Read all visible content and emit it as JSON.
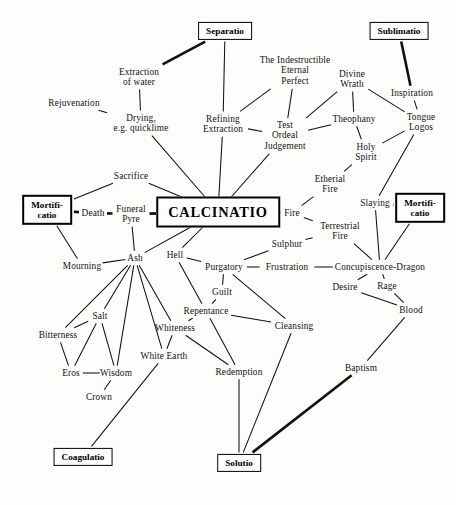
{
  "diagram": {
    "center": {
      "label": "CALCINATIO",
      "x": 218,
      "y": 212
    },
    "boxes": [
      {
        "id": "separatio",
        "label": "Separatio",
        "x": 225,
        "y": 31,
        "lines": [
          "Separatio"
        ]
      },
      {
        "id": "sublimatio",
        "label": "Sublimatio",
        "x": 399,
        "y": 31,
        "lines": [
          "Sublimatio"
        ]
      },
      {
        "id": "mortificatio_left",
        "label": "Mortifi- catio",
        "x": 47,
        "y": 210,
        "lines": [
          "Mortifi-",
          "catio"
        ]
      },
      {
        "id": "mortificatio_right",
        "label": "Mortifi- catio",
        "x": 420,
        "y": 208,
        "lines": [
          "Mortifi-",
          "catio"
        ]
      },
      {
        "id": "coagulatio",
        "label": "Coagulatio",
        "x": 83,
        "y": 457,
        "lines": [
          "Coagulatio"
        ]
      },
      {
        "id": "solutio",
        "label": "Solutio",
        "x": 239,
        "y": 463,
        "lines": [
          "Solutio"
        ]
      }
    ],
    "nodes": [
      {
        "id": "extraction_of_water",
        "lines": [
          "Extraction",
          "of water"
        ],
        "x": 139,
        "y": 77
      },
      {
        "id": "rejuvenation",
        "lines": [
          "Rejuvenation"
        ],
        "x": 74,
        "y": 103
      },
      {
        "id": "drying_quicklime",
        "lines": [
          "Drying,",
          "e.g. quicklime"
        ],
        "x": 141,
        "y": 123
      },
      {
        "id": "refining_extraction",
        "lines": [
          "Refining",
          "Extraction"
        ],
        "x": 223,
        "y": 124
      },
      {
        "id": "indestructible",
        "lines": [
          "The Indestructible",
          "Eternal",
          "Perfect"
        ],
        "x": 295,
        "y": 71
      },
      {
        "id": "test_ordeal_judgement",
        "lines": [
          "Test",
          "Ordeal",
          "Judgement"
        ],
        "x": 285,
        "y": 136
      },
      {
        "id": "divine_wrath",
        "lines": [
          "Divine",
          "Wrath"
        ],
        "x": 352,
        "y": 79
      },
      {
        "id": "theophany",
        "lines": [
          "Theophany"
        ],
        "x": 354,
        "y": 119
      },
      {
        "id": "inspiration",
        "lines": [
          "Inspiration"
        ],
        "x": 412,
        "y": 93
      },
      {
        "id": "tongue_logos",
        "lines": [
          "Tongue",
          "Logos"
        ],
        "x": 421,
        "y": 122
      },
      {
        "id": "holy_spirit",
        "lines": [
          "Holy",
          "Spirit"
        ],
        "x": 366,
        "y": 152
      },
      {
        "id": "etherial_fire",
        "lines": [
          "Etherial",
          "Fire"
        ],
        "x": 330,
        "y": 184
      },
      {
        "id": "slaying",
        "lines": [
          "Slaying"
        ],
        "x": 375,
        "y": 203
      },
      {
        "id": "fire",
        "lines": [
          "Fire"
        ],
        "x": 292,
        "y": 213
      },
      {
        "id": "terrestrial_fire",
        "lines": [
          "Terrestrial",
          "Fire"
        ],
        "x": 340,
        "y": 231
      },
      {
        "id": "sulphur",
        "lines": [
          "Sulphur"
        ],
        "x": 287,
        "y": 244
      },
      {
        "id": "sacrifice",
        "lines": [
          "Sacrifice"
        ],
        "x": 131,
        "y": 176
      },
      {
        "id": "death",
        "lines": [
          "Death"
        ],
        "x": 93,
        "y": 213
      },
      {
        "id": "funeral_pyre",
        "lines": [
          "Funeral",
          "Pyre"
        ],
        "x": 131,
        "y": 214
      },
      {
        "id": "ash",
        "lines": [
          "Ash"
        ],
        "x": 135,
        "y": 258
      },
      {
        "id": "mourning",
        "lines": [
          "Mourning"
        ],
        "x": 82,
        "y": 266
      },
      {
        "id": "hell",
        "lines": [
          "Hell"
        ],
        "x": 175,
        "y": 255
      },
      {
        "id": "purgatory",
        "lines": [
          "Purgatory"
        ],
        "x": 224,
        "y": 267
      },
      {
        "id": "frustration",
        "lines": [
          "Frustration"
        ],
        "x": 287,
        "y": 267
      },
      {
        "id": "concupiscence_dragon",
        "lines": [
          "Concupiscence-Dragon"
        ],
        "x": 380,
        "y": 267
      },
      {
        "id": "desire",
        "lines": [
          "Desire"
        ],
        "x": 345,
        "y": 287
      },
      {
        "id": "rage",
        "lines": [
          "Rage"
        ],
        "x": 387,
        "y": 286
      },
      {
        "id": "blood",
        "lines": [
          "Blood"
        ],
        "x": 411,
        "y": 310
      },
      {
        "id": "guilt",
        "lines": [
          "Guilt"
        ],
        "x": 222,
        "y": 292
      },
      {
        "id": "repentance",
        "lines": [
          "Repentance"
        ],
        "x": 206,
        "y": 311
      },
      {
        "id": "whiteness",
        "lines": [
          "Whiteness"
        ],
        "x": 175,
        "y": 328
      },
      {
        "id": "bitterness",
        "lines": [
          "Bitterness"
        ],
        "x": 58,
        "y": 335
      },
      {
        "id": "salt",
        "lines": [
          "Salt"
        ],
        "x": 100,
        "y": 316
      },
      {
        "id": "cleansing",
        "lines": [
          "Cleansing"
        ],
        "x": 294,
        "y": 326
      },
      {
        "id": "white_earth",
        "lines": [
          "White Earth"
        ],
        "x": 164,
        "y": 356
      },
      {
        "id": "eros",
        "lines": [
          "Eros"
        ],
        "x": 71,
        "y": 373
      },
      {
        "id": "wisdom",
        "lines": [
          "Wisdom"
        ],
        "x": 116,
        "y": 373
      },
      {
        "id": "crown",
        "lines": [
          "Crown"
        ],
        "x": 99,
        "y": 397
      },
      {
        "id": "redemption",
        "lines": [
          "Redemption"
        ],
        "x": 239,
        "y": 372
      },
      {
        "id": "baptism",
        "lines": [
          "Baptism"
        ],
        "x": 361,
        "y": 368
      }
    ],
    "edges": [
      {
        "from": "separatio",
        "to": "extraction_of_water",
        "weight": "thick"
      },
      {
        "from": "separatio",
        "to": "refining_extraction",
        "weight": "thin"
      },
      {
        "from": "extraction_of_water",
        "to": "drying_quicklime",
        "weight": "thin"
      },
      {
        "from": "rejuvenation",
        "to": "drying_quicklime",
        "weight": "thin"
      },
      {
        "from": "drying_quicklime",
        "to": "center",
        "weight": "thin"
      },
      {
        "from": "refining_extraction",
        "to": "center",
        "weight": "thin"
      },
      {
        "from": "refining_extraction",
        "to": "test_ordeal_judgement",
        "weight": "thin"
      },
      {
        "from": "refining_extraction",
        "to": "indestructible",
        "weight": "thin"
      },
      {
        "from": "indestructible",
        "to": "test_ordeal_judgement",
        "weight": "thin"
      },
      {
        "from": "test_ordeal_judgement",
        "to": "center",
        "weight": "thin"
      },
      {
        "from": "test_ordeal_judgement",
        "to": "divine_wrath",
        "weight": "thin"
      },
      {
        "from": "test_ordeal_judgement",
        "to": "theophany",
        "weight": "thin"
      },
      {
        "from": "divine_wrath",
        "to": "theophany",
        "weight": "thin"
      },
      {
        "from": "divine_wrath",
        "to": "tongue_logos",
        "weight": "thin"
      },
      {
        "from": "sublimatio",
        "to": "inspiration",
        "weight": "thick"
      },
      {
        "from": "inspiration",
        "to": "tongue_logos",
        "weight": "thin"
      },
      {
        "from": "theophany",
        "to": "holy_spirit",
        "weight": "thin"
      },
      {
        "from": "holy_spirit",
        "to": "tongue_logos",
        "weight": "thin"
      },
      {
        "from": "tongue_logos",
        "to": "slaying",
        "weight": "thin"
      },
      {
        "from": "holy_spirit",
        "to": "etherial_fire",
        "weight": "thin"
      },
      {
        "from": "etherial_fire",
        "to": "fire",
        "weight": "thin"
      },
      {
        "from": "center",
        "to": "fire",
        "weight": "thick"
      },
      {
        "from": "fire",
        "to": "terrestrial_fire",
        "weight": "thin"
      },
      {
        "from": "sulphur",
        "to": "terrestrial_fire",
        "weight": "thin"
      },
      {
        "from": "sulphur",
        "to": "purgatory",
        "weight": "thin"
      },
      {
        "from": "terrestrial_fire",
        "to": "concupiscence_dragon",
        "weight": "thin"
      },
      {
        "from": "slaying",
        "to": "mortificatio_right",
        "weight": "thick"
      },
      {
        "from": "slaying",
        "to": "concupiscence_dragon",
        "weight": "thin"
      },
      {
        "from": "mortificatio_right",
        "to": "concupiscence_dragon",
        "weight": "thin"
      },
      {
        "from": "center",
        "to": "sacrifice",
        "weight": "thin"
      },
      {
        "from": "sacrifice",
        "to": "mortificatio_left",
        "weight": "thin"
      },
      {
        "from": "mortificatio_left",
        "to": "death",
        "weight": "thick"
      },
      {
        "from": "death",
        "to": "funeral_pyre",
        "weight": "thick"
      },
      {
        "from": "funeral_pyre",
        "to": "center",
        "weight": "thick"
      },
      {
        "from": "funeral_pyre",
        "to": "ash",
        "weight": "thin"
      },
      {
        "from": "mortificatio_left",
        "to": "mourning",
        "weight": "thin"
      },
      {
        "from": "mourning",
        "to": "ash",
        "weight": "thin"
      },
      {
        "from": "center",
        "to": "ash",
        "weight": "thin"
      },
      {
        "from": "center",
        "to": "hell",
        "weight": "thin"
      },
      {
        "from": "hell",
        "to": "purgatory",
        "weight": "thin"
      },
      {
        "from": "hell",
        "to": "repentance",
        "weight": "thin"
      },
      {
        "from": "purgatory",
        "to": "frustration",
        "weight": "thin"
      },
      {
        "from": "purgatory",
        "to": "guilt",
        "weight": "thin"
      },
      {
        "from": "purgatory",
        "to": "cleansing",
        "weight": "thin"
      },
      {
        "from": "frustration",
        "to": "concupiscence_dragon",
        "weight": "thin"
      },
      {
        "from": "concupiscence_dragon",
        "to": "desire",
        "weight": "thin"
      },
      {
        "from": "concupiscence_dragon",
        "to": "rage",
        "weight": "thin"
      },
      {
        "from": "desire",
        "to": "blood",
        "weight": "thin"
      },
      {
        "from": "rage",
        "to": "blood",
        "weight": "thin"
      },
      {
        "from": "blood",
        "to": "baptism",
        "weight": "thin"
      },
      {
        "from": "baptism",
        "to": "solutio",
        "weight": "thick"
      },
      {
        "from": "guilt",
        "to": "repentance",
        "weight": "thin"
      },
      {
        "from": "repentance",
        "to": "cleansing",
        "weight": "thin"
      },
      {
        "from": "repentance",
        "to": "whiteness",
        "weight": "thin"
      },
      {
        "from": "repentance",
        "to": "redemption",
        "weight": "thin"
      },
      {
        "from": "cleansing",
        "to": "solutio",
        "weight": "thin"
      },
      {
        "from": "redemption",
        "to": "solutio",
        "weight": "thin"
      },
      {
        "from": "ash",
        "to": "salt",
        "weight": "thin"
      },
      {
        "from": "ash",
        "to": "bitterness",
        "weight": "thin"
      },
      {
        "from": "ash",
        "to": "white_earth",
        "weight": "thin"
      },
      {
        "from": "ash",
        "to": "whiteness",
        "weight": "thin"
      },
      {
        "from": "ash",
        "to": "wisdom",
        "weight": "thin"
      },
      {
        "from": "salt",
        "to": "bitterness",
        "weight": "thin"
      },
      {
        "from": "salt",
        "to": "eros",
        "weight": "thin"
      },
      {
        "from": "salt",
        "to": "wisdom",
        "weight": "thin"
      },
      {
        "from": "bitterness",
        "to": "eros",
        "weight": "thin"
      },
      {
        "from": "eros",
        "to": "wisdom",
        "weight": "thin"
      },
      {
        "from": "wisdom",
        "to": "crown",
        "weight": "thin"
      },
      {
        "from": "whiteness",
        "to": "white_earth",
        "weight": "thin"
      },
      {
        "from": "whiteness",
        "to": "redemption",
        "weight": "thin"
      },
      {
        "from": "white_earth",
        "to": "coagulatio",
        "weight": "thin"
      }
    ]
  }
}
